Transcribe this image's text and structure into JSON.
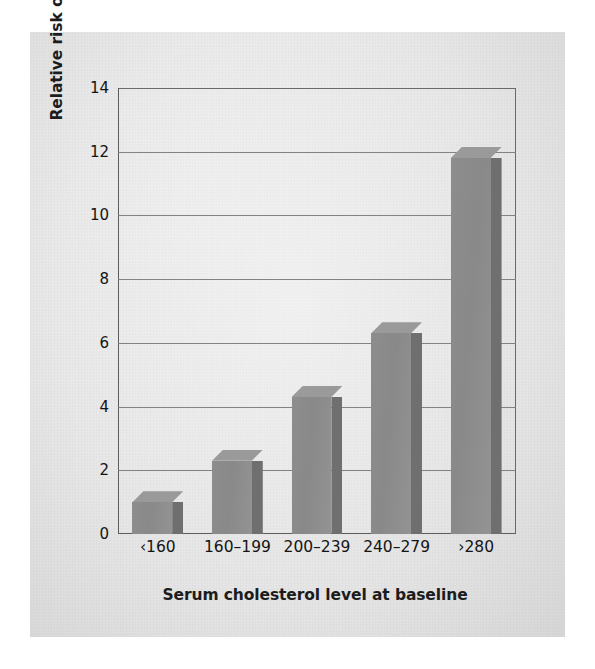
{
  "chart_data": {
    "type": "bar",
    "title": "",
    "subtitle": "",
    "xlabel": "Serum cholesterol level at baseline",
    "ylabel": "Relative risk of mortality due to coronary disease",
    "categories": [
      "‹160",
      "160–199",
      "200–239",
      "240–279",
      "›280"
    ],
    "values": [
      1.0,
      2.3,
      4.3,
      6.3,
      11.8
    ],
    "ylim": [
      0,
      14
    ],
    "ytick_values": [
      0,
      2,
      4,
      6,
      8,
      10,
      12,
      14
    ],
    "ytick_labels": [
      "0",
      "2",
      "4",
      "6",
      "8",
      "10",
      "12",
      "14"
    ],
    "ytick_step": 2,
    "grid": "horizontal",
    "legend": "none",
    "bar_style": "3d-extruded",
    "colors": {
      "bar_face": "#8d8d8d",
      "bar_side": "#6f6f6f",
      "bar_top": "#9a9a9a",
      "gridline": "#7a7a7a",
      "axis": "#5d5d5d",
      "text": "#141414",
      "plot_background": "#e8e8e8",
      "page_background": "#ffffff"
    }
  }
}
